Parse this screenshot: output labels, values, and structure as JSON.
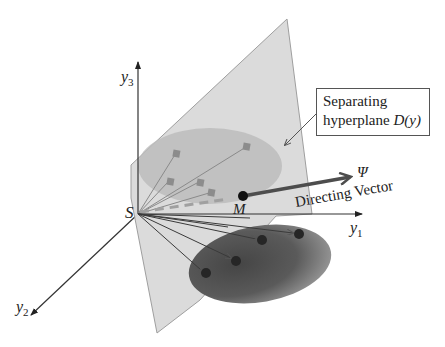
{
  "figure": {
    "labels": {
      "origin": "S",
      "mean_point": "M",
      "axis_y1": "y",
      "axis_y1_sub": "1",
      "axis_y2": "y",
      "axis_y2_sub": "2",
      "axis_y3": "y",
      "axis_y3_sub": "3",
      "psi": "Ψ",
      "directing_vector": "Directing Vector"
    },
    "callout": {
      "line1": "Separating",
      "line2_prefix": "hyperplane ",
      "line2_math": "D(y)"
    },
    "colors": {
      "plane_fill": "#d9d9d9",
      "plane_edge": "#9a9a9a",
      "upper_cluster_fill": "#bdbdbd",
      "lower_cluster_dark": "#4a4a4a",
      "lower_cluster_light": "#9a9a9a",
      "axis": "#333333",
      "square_marker": "#8c8c8c",
      "round_marker": "#262626",
      "directing_vector": "#4d4d4d"
    },
    "upper_cluster_points": 5,
    "lower_cluster_points": 4
  }
}
